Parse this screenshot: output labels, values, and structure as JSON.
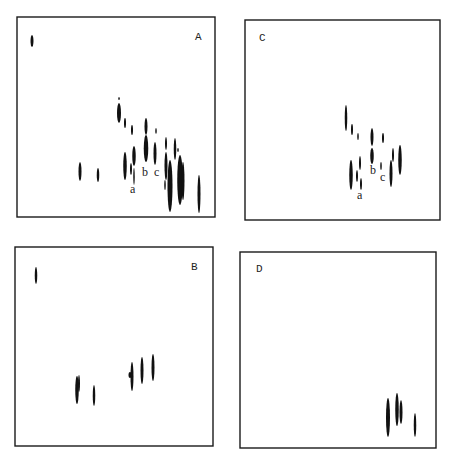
{
  "figure": {
    "ink_color": "#111111",
    "frame_color": "#1a1a1a",
    "background": "#ffffff"
  },
  "panels": [
    {
      "id": "A",
      "label": "A",
      "frame": {
        "x1": 17,
        "y1": 17,
        "x2": 215,
        "y2": 217
      },
      "label_pos": {
        "x": 195,
        "y": 40
      },
      "spot_labels": [
        {
          "text": "a",
          "x": 130,
          "y": 193
        },
        {
          "text": "b",
          "x": 142,
          "y": 176
        },
        {
          "text": "c",
          "x": 154,
          "y": 176
        }
      ],
      "spots": [
        {
          "cx": 32,
          "y1": 35,
          "y2": 47,
          "w": 3
        },
        {
          "cx": 119,
          "y1": 97,
          "y2": 100,
          "w": 1.5
        },
        {
          "cx": 119,
          "y1": 103,
          "y2": 123,
          "w": 4
        },
        {
          "cx": 125,
          "y1": 118,
          "y2": 128,
          "w": 2
        },
        {
          "cx": 132,
          "y1": 125,
          "y2": 135,
          "w": 2
        },
        {
          "cx": 146,
          "y1": 118,
          "y2": 135,
          "w": 3
        },
        {
          "cx": 146,
          "y1": 135,
          "y2": 162,
          "w": 4.5
        },
        {
          "cx": 156,
          "y1": 128,
          "y2": 134,
          "w": 1.5
        },
        {
          "cx": 155,
          "y1": 142,
          "y2": 165,
          "w": 3
        },
        {
          "cx": 134,
          "y1": 146,
          "y2": 166,
          "w": 3.5
        },
        {
          "cx": 125,
          "y1": 152,
          "y2": 180,
          "w": 3.5
        },
        {
          "cx": 131,
          "y1": 163,
          "y2": 175,
          "w": 2
        },
        {
          "cx": 134,
          "y1": 168,
          "y2": 185,
          "w": 1.5
        },
        {
          "cx": 80,
          "y1": 162,
          "y2": 181,
          "w": 3
        },
        {
          "cx": 98,
          "y1": 168,
          "y2": 182,
          "w": 2.5
        },
        {
          "cx": 166,
          "y1": 137,
          "y2": 150,
          "w": 2
        },
        {
          "cx": 166,
          "y1": 152,
          "y2": 180,
          "w": 3
        },
        {
          "cx": 165,
          "y1": 180,
          "y2": 190,
          "w": 1.5
        },
        {
          "cx": 170,
          "y1": 160,
          "y2": 212,
          "w": 5
        },
        {
          "cx": 175,
          "y1": 138,
          "y2": 160,
          "w": 2.5
        },
        {
          "cx": 178,
          "y1": 148,
          "y2": 152,
          "w": 1.5
        },
        {
          "cx": 180,
          "y1": 155,
          "y2": 205,
          "w": 5.5
        },
        {
          "cx": 183,
          "y1": 162,
          "y2": 200,
          "w": 3
        },
        {
          "cx": 199,
          "y1": 175,
          "y2": 213,
          "w": 3
        }
      ]
    },
    {
      "id": "C",
      "label": "C",
      "frame": {
        "x1": 245,
        "y1": 20,
        "x2": 440,
        "y2": 220
      },
      "label_pos": {
        "x": 259,
        "y": 41
      },
      "spot_labels": [
        {
          "text": "a",
          "x": 357,
          "y": 199
        },
        {
          "text": "b",
          "x": 370,
          "y": 174
        },
        {
          "text": "c",
          "x": 380,
          "y": 181
        }
      ],
      "spots": [
        {
          "cx": 346,
          "y1": 105,
          "y2": 131,
          "w": 2.5
        },
        {
          "cx": 352,
          "y1": 124,
          "y2": 135,
          "w": 2
        },
        {
          "cx": 358,
          "y1": 133,
          "y2": 140,
          "w": 1.5
        },
        {
          "cx": 372,
          "y1": 128,
          "y2": 146,
          "w": 3
        },
        {
          "cx": 372,
          "y1": 148,
          "y2": 164,
          "w": 3.5
        },
        {
          "cx": 383,
          "y1": 133,
          "y2": 143,
          "w": 2
        },
        {
          "cx": 351,
          "y1": 160,
          "y2": 190,
          "w": 3.5
        },
        {
          "cx": 357,
          "y1": 170,
          "y2": 182,
          "w": 2
        },
        {
          "cx": 360,
          "y1": 156,
          "y2": 170,
          "w": 2
        },
        {
          "cx": 361,
          "y1": 178,
          "y2": 190,
          "w": 2
        },
        {
          "cx": 381,
          "y1": 162,
          "y2": 170,
          "w": 1.5
        },
        {
          "cx": 393,
          "y1": 148,
          "y2": 162,
          "w": 2
        },
        {
          "cx": 391,
          "y1": 160,
          "y2": 187,
          "w": 3
        },
        {
          "cx": 400,
          "y1": 145,
          "y2": 175,
          "w": 3.5
        }
      ]
    },
    {
      "id": "B",
      "label": "B",
      "frame": {
        "x1": 15,
        "y1": 247,
        "x2": 213,
        "y2": 446
      },
      "label_pos": {
        "x": 191,
        "y": 270
      },
      "spot_labels": [],
      "spots": [
        {
          "cx": 36,
          "y1": 267,
          "y2": 284,
          "w": 2.5
        },
        {
          "cx": 77,
          "y1": 376,
          "y2": 404,
          "w": 3.5
        },
        {
          "cx": 79,
          "y1": 375,
          "y2": 392,
          "w": 2
        },
        {
          "cx": 94,
          "y1": 385,
          "y2": 406,
          "w": 2.5
        },
        {
          "cx": 132,
          "y1": 362,
          "y2": 391,
          "w": 3
        },
        {
          "cx": 130,
          "y1": 372,
          "y2": 378,
          "w": 3
        },
        {
          "cx": 142,
          "y1": 357,
          "y2": 384,
          "w": 3
        },
        {
          "cx": 153,
          "y1": 354,
          "y2": 381,
          "w": 3
        }
      ]
    },
    {
      "id": "D",
      "label": "D",
      "frame": {
        "x1": 240,
        "y1": 252,
        "x2": 436,
        "y2": 448
      },
      "label_pos": {
        "x": 256,
        "y": 272
      },
      "spot_labels": [],
      "spots": [
        {
          "cx": 388,
          "y1": 398,
          "y2": 437,
          "w": 4
        },
        {
          "cx": 397,
          "y1": 393,
          "y2": 426,
          "w": 3.5
        },
        {
          "cx": 401,
          "y1": 400,
          "y2": 424,
          "w": 3
        },
        {
          "cx": 415,
          "y1": 413,
          "y2": 437,
          "w": 2.5
        }
      ]
    }
  ]
}
